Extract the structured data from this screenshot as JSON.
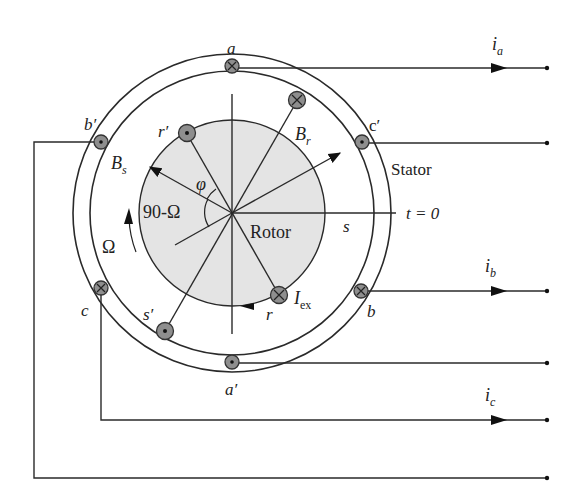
{
  "figure": {
    "labels": {
      "stator": "Stator",
      "rotor": "Rotor",
      "t0": "t = 0",
      "s": "s",
      "B_s": "B",
      "B_s_sub": "s",
      "B_r": "B",
      "B_r_sub": "r",
      "phi": "φ",
      "angle_90": "90-Ω",
      "omega": "Ω",
      "I_ex": "I",
      "I_ex_sub": "ex",
      "r": "r",
      "r_prime": "r′",
      "s_prime": "s′"
    },
    "stator_conductors": [
      {
        "name": "a",
        "label": "a",
        "direction": "into-page"
      },
      {
        "name": "a-prime",
        "label": "a′",
        "direction": "out-of-page"
      },
      {
        "name": "b",
        "label": "b",
        "direction": "into-page"
      },
      {
        "name": "b-prime",
        "label": "b′",
        "direction": "out-of-page"
      },
      {
        "name": "c",
        "label": "c",
        "direction": "into-page"
      },
      {
        "name": "c-prime",
        "label": "c′",
        "direction": "out-of-page"
      }
    ],
    "rotor_conductors": [
      {
        "name": "r",
        "label": "r",
        "direction": "into-page"
      },
      {
        "name": "r-prime",
        "label": "r′",
        "direction": "out-of-page"
      },
      {
        "name": "s-prime",
        "label": "s′",
        "direction": "out-of-page"
      },
      {
        "name": "s",
        "label": "",
        "direction": "into-page"
      }
    ],
    "currents": [
      {
        "name": "i-a",
        "label": "i",
        "sub": "a"
      },
      {
        "name": "i-b",
        "label": "i",
        "sub": "b"
      },
      {
        "name": "i-c",
        "label": "i",
        "sub": "c"
      }
    ]
  }
}
